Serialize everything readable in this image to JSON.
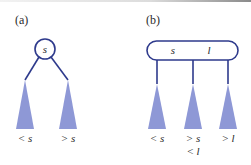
{
  "colors": {
    "stroke": "#2e3a8c",
    "subtree_fill": "#8e98d6",
    "text": "#2b2b2b"
  },
  "panel_a": {
    "label": "(a)",
    "node_key": "s",
    "subtrees": [
      {
        "label": "< s"
      },
      {
        "label": "> s"
      }
    ]
  },
  "panel_b": {
    "label": "(b)",
    "node_keys": [
      "s",
      "l"
    ],
    "subtrees": [
      {
        "label": "< s",
        "label2": ""
      },
      {
        "label": "> s",
        "label2": "< l"
      },
      {
        "label": "> l",
        "label2": ""
      }
    ]
  }
}
